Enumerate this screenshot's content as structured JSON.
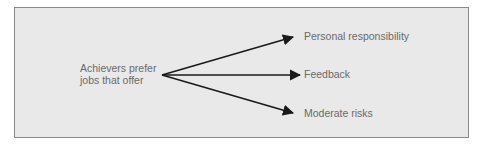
{
  "diagram": {
    "source": {
      "line1": "Achievers prefer",
      "line2": "jobs that offer"
    },
    "targets": [
      {
        "label": "Personal responsibility"
      },
      {
        "label": "Feedback"
      },
      {
        "label": "Moderate risks"
      }
    ],
    "colors": {
      "background": "#e9e9e9",
      "border": "#8a8a8a",
      "arrow": "#1a1a1a",
      "text": "#6a6a6a"
    }
  }
}
